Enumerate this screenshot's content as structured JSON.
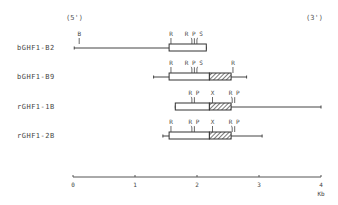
{
  "diagram": {
    "end_labels": {
      "five_prime": "(5')",
      "three_prime": "(3')"
    },
    "scale": {
      "ticks": [
        "0",
        "1",
        "2",
        "3",
        "4"
      ],
      "unit": "Kb",
      "px_per_kb": 62,
      "origin_x": 73
    },
    "constructs": [
      {
        "name": "bGHF1-B2",
        "y": 48,
        "line": [
          0.02,
          2.15
        ],
        "box": [
          1.55,
          2.15
        ],
        "hatched": null,
        "sites": [
          {
            "label": "B",
            "kb": 0.1
          },
          {
            "label": "R",
            "kb": 1.58
          },
          {
            "label": "R P S",
            "kb": 1.95
          }
        ]
      },
      {
        "name": "bGHF1-B9",
        "y": 77,
        "line": [
          1.3,
          2.8
        ],
        "box": [
          1.55,
          2.2
        ],
        "hatched": [
          2.2,
          2.55
        ],
        "sites": [
          {
            "label": "R",
            "kb": 1.58
          },
          {
            "label": "R P S",
            "kb": 1.95
          },
          {
            "label": "R",
            "kb": 2.58
          }
        ]
      },
      {
        "name": "rGHF1-1B",
        "y": 107,
        "line": [
          1.65,
          4.0
        ],
        "box": [
          1.65,
          2.2
        ],
        "hatched": [
          2.2,
          2.55
        ],
        "sites": [
          {
            "label": "R P",
            "kb": 1.95
          },
          {
            "label": "X",
            "kb": 2.25
          },
          {
            "label": "R P",
            "kb": 2.6
          }
        ]
      },
      {
        "name": "rGHF1-2B",
        "y": 136,
        "line": [
          1.45,
          3.05
        ],
        "box": [
          1.55,
          2.2
        ],
        "hatched": [
          2.2,
          2.55
        ],
        "sites": [
          {
            "label": "R",
            "kb": 1.58
          },
          {
            "label": "R P",
            "kb": 1.95
          },
          {
            "label": "X",
            "kb": 2.25
          },
          {
            "label": "R P",
            "kb": 2.6
          }
        ]
      }
    ]
  }
}
